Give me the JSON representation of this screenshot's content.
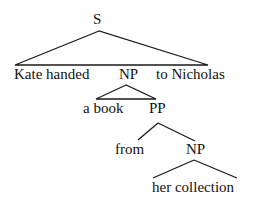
{
  "diagram": {
    "type": "syntax-tree",
    "root": {
      "label": "S",
      "children": [
        {
          "label": "Kate handed"
        },
        {
          "label": "NP",
          "children": [
            {
              "label": "a book"
            },
            {
              "label": "PP",
              "children": [
                {
                  "label": "from"
                },
                {
                  "label": "NP",
                  "children": [
                    {
                      "label": "her collection"
                    }
                  ]
                }
              ]
            }
          ]
        },
        {
          "label": "to Nicholas"
        }
      ]
    },
    "nodes": {
      "s": "S",
      "kate_handed": "Kate handed",
      "np1": "NP",
      "to_nicholas": "to Nicholas",
      "a_book": "a book",
      "pp": "PP",
      "from": "from",
      "np2": "NP",
      "her_collection": "her collection"
    },
    "line_color": "#1a1a1a",
    "text_color": "#111111"
  }
}
